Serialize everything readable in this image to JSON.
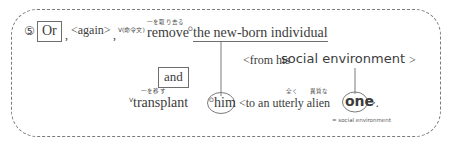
{
  "diagram": {
    "border_style": "dashed-rounded-rectangle",
    "border_color": "#7a7a7a",
    "text_color": "#3c3c3c"
  },
  "line1": {
    "item_number": "⑤",
    "or_box": "Or",
    "comma1": ",",
    "again": "<again>",
    "comma2": ",",
    "mark_v": "V(命令文)",
    "gloss_remove": "一を取り去る",
    "remove": "remove",
    "mark_o": "O",
    "new_born_individual": "the new-born individual"
  },
  "line2": {
    "from_his": "<from his",
    "social_environment": "social environment",
    "close_bracket": ">"
  },
  "connector_box": {
    "and_box": "and"
  },
  "line3": {
    "mark_v": "V",
    "gloss_transplant": "一を移す",
    "transplant": "transplant",
    "mark_o": "O",
    "him": "him",
    "to_an_utterly_alien": "<to an utterly alien",
    "gloss_utterly": "全く",
    "gloss_alien": "異質な",
    "one": "one",
    "tail": ">."
  },
  "footnote": {
    "text": "= social environment"
  }
}
